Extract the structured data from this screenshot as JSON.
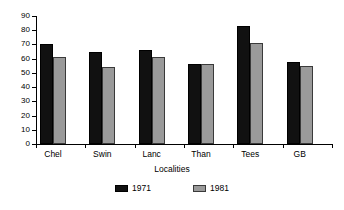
{
  "chart_data": {
    "type": "bar",
    "title": "",
    "xlabel": "Localities",
    "ylabel": "",
    "categories": [
      "Chel",
      "Swin",
      "Lanc",
      "Than",
      "Tees",
      "GB"
    ],
    "series": [
      {
        "name": "1971",
        "color": "#111111",
        "values": [
          70,
          65,
          66,
          56,
          83,
          58
        ]
      },
      {
        "name": "1981",
        "color": "#9a9a9a",
        "values": [
          61,
          54,
          61,
          56,
          71,
          55
        ]
      }
    ],
    "ylim": [
      0,
      90
    ],
    "ytick_step": 10,
    "yticks": [
      0,
      10,
      20,
      30,
      40,
      50,
      60,
      70,
      80,
      90
    ],
    "ytick_labels": [
      "0",
      "10",
      "20",
      "30",
      "40",
      "50",
      "60",
      "70",
      "80",
      "90"
    ],
    "grid": false,
    "legend_position": "bottom"
  },
  "legend": {
    "items": [
      {
        "label": "1971"
      },
      {
        "label": "1981"
      }
    ]
  },
  "axes": {
    "x_title": "Localities"
  }
}
